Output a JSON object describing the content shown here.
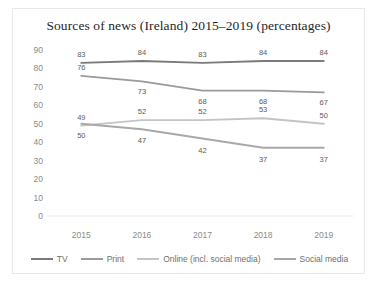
{
  "chart_data": {
    "type": "line",
    "title": "Sources of news (Ireland) 2015–2019 (percentages)",
    "xlabel": "",
    "ylabel": "",
    "categories": [
      "2015",
      "2016",
      "2017",
      "2018",
      "2019"
    ],
    "ylim": [
      0,
      90
    ],
    "yticks": [
      0,
      10,
      20,
      30,
      40,
      50,
      60,
      70,
      80,
      90
    ],
    "grid": false,
    "legend_position": "bottom",
    "series": [
      {
        "name": "TV",
        "color": "#7a7a7a",
        "values": [
          83,
          84,
          83,
          84,
          84
        ],
        "label_offsets": [
          -9,
          -9,
          -9,
          -9,
          -9
        ]
      },
      {
        "name": "Print",
        "color": "#9a9a9a",
        "values": [
          76,
          73,
          68,
          68,
          67
        ],
        "label_offsets": [
          -9,
          10,
          10,
          10,
          10
        ]
      },
      {
        "name": "Online (incl. social media)",
        "color": "#c4c4c4",
        "values": [
          49,
          52,
          52,
          53,
          50
        ],
        "label_offsets": [
          -9,
          -9,
          -9,
          -9,
          -9
        ]
      },
      {
        "name": "Social media",
        "color": "#a8a8a8",
        "values": [
          50,
          47,
          42,
          37,
          37
        ],
        "label_offsets": [
          11,
          11,
          11,
          11,
          11
        ]
      }
    ]
  },
  "legend": {
    "items": [
      {
        "label": "TV",
        "color": "#7a7a7a"
      },
      {
        "label": "Print",
        "color": "#9a9a9a"
      },
      {
        "label": "Online (incl. social media)",
        "color": "#c4c4c4"
      },
      {
        "label": "Social media",
        "color": "#a8a8a8"
      }
    ]
  },
  "colors": {
    "frame": "#e8e8e8",
    "tick_text": "#8a8a8a",
    "data_label_text": "#5a5a5a",
    "title_text": "#1f1f1f",
    "background": "#ffffff"
  }
}
